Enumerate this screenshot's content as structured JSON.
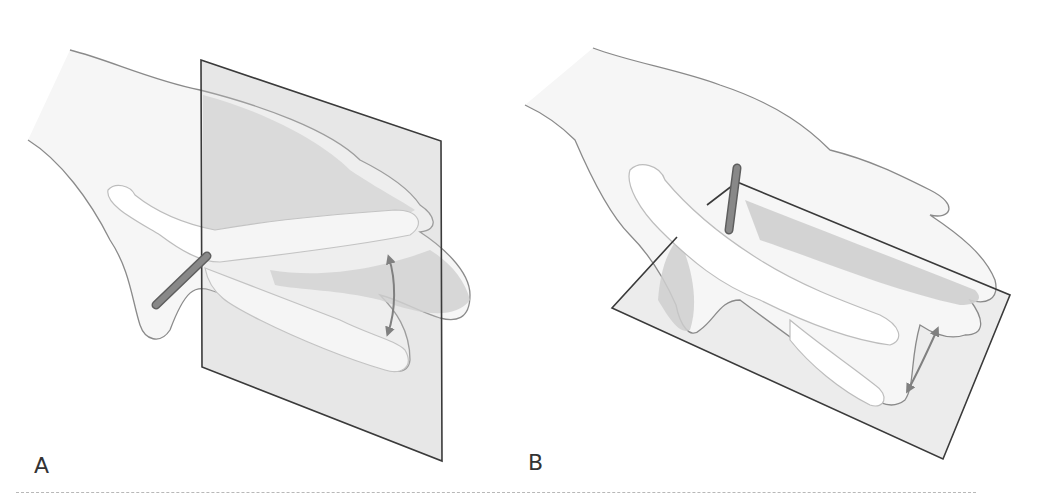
{
  "figure": {
    "panels": [
      {
        "id": "A",
        "label": "A",
        "plane": "vertical plane",
        "motion": "thumb abduction/adduction arc"
      },
      {
        "id": "B",
        "label": "B",
        "plane": "horizontal plane",
        "motion": "thumb flexion/extension arc"
      }
    ]
  },
  "colors": {
    "skin_fill": "#f4f4f4",
    "outline": "#8a8a8a",
    "bone_fill": "#ffffff",
    "bone_outline": "#bdbdbd",
    "plane_fill": "#d9d9d9",
    "plane_shadow": "#c8c8c8",
    "plane_edge": "#3a3a3a",
    "axis_rod": "#7a7a7a",
    "arrow": "#808080",
    "divider": "#b8b8b8"
  }
}
